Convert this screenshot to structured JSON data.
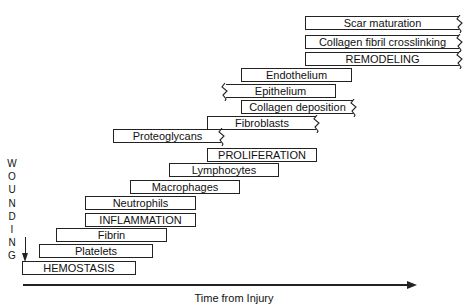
{
  "diagram": {
    "vertical_label": [
      "W",
      "O",
      "U",
      "N",
      "D",
      "I",
      "N",
      "G"
    ],
    "x_axis_label": "Time from Injury",
    "bars": [
      {
        "label": "Scar maturation",
        "x": 305,
        "y": 16,
        "w": 154,
        "open": "right"
      },
      {
        "label": "Collagen fibril crosslinking",
        "x": 305,
        "y": 35,
        "w": 154,
        "open": "right"
      },
      {
        "label": "REMODELING",
        "x": 305,
        "y": 52,
        "w": 154,
        "open": "right"
      },
      {
        "label": "Endothelium",
        "x": 241,
        "y": 68,
        "w": 111,
        "open": "none"
      },
      {
        "label": "Epithelium",
        "x": 226,
        "y": 84,
        "w": 110,
        "open": "left"
      },
      {
        "label": "Collagen deposition",
        "x": 241,
        "y": 100,
        "w": 112,
        "open": "right"
      },
      {
        "label": "Fibroblasts",
        "x": 207,
        "y": 116,
        "w": 109,
        "open": "right"
      },
      {
        "label": "Proteoglycans",
        "x": 113,
        "y": 129,
        "w": 108,
        "open": "right"
      },
      {
        "label": "PROLIFERATION",
        "x": 207,
        "y": 148,
        "w": 110,
        "open": "none"
      },
      {
        "label": "Lymphocytes",
        "x": 169,
        "y": 163,
        "w": 110,
        "open": "none"
      },
      {
        "label": "Macrophages",
        "x": 130,
        "y": 180,
        "w": 110,
        "open": "none"
      },
      {
        "label": "Neutrophils",
        "x": 85,
        "y": 196,
        "w": 111,
        "open": "none"
      },
      {
        "label": "INFLAMMATION",
        "x": 85,
        "y": 213,
        "w": 111,
        "open": "none"
      },
      {
        "label": "Fibrin",
        "x": 56,
        "y": 228,
        "w": 111,
        "open": "none"
      },
      {
        "label": "Platelets",
        "x": 39,
        "y": 244,
        "w": 114,
        "open": "none"
      },
      {
        "label": "HEMOSTASIS",
        "x": 22,
        "y": 261,
        "w": 114,
        "open": "none"
      }
    ]
  }
}
